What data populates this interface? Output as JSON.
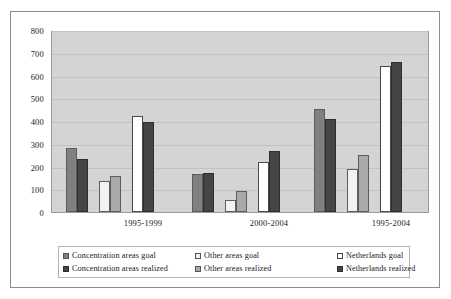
{
  "chart_data": {
    "type": "bar",
    "title": "",
    "xlabel": "",
    "ylabel": "",
    "ylim": [
      0,
      800
    ],
    "ytick_step": 100,
    "yticks": [
      "800",
      "700",
      "600",
      "500",
      "400",
      "300",
      "200",
      "100",
      "0"
    ],
    "grid": true,
    "legend_position": "bottom",
    "categories": [
      "1995-1999",
      "2000-2004",
      "1995-2004"
    ],
    "series": [
      {
        "name": "Concentration areas goal",
        "color": "#808080",
        "values": [
          285,
          168,
          458
        ]
      },
      {
        "name": "Concentration areas realized",
        "color": "#454545",
        "values": [
          237,
          172,
          413
        ]
      },
      {
        "name": "Other areas goal",
        "color": "#f2f2f2",
        "values": [
          140,
          52,
          192
        ]
      },
      {
        "name": "Other areas realized",
        "color": "#a9a9a9",
        "values": [
          158,
          95,
          253
        ]
      },
      {
        "name": "Netherlands goal",
        "color": "#ffffff",
        "values": [
          425,
          222,
          650
        ]
      },
      {
        "name": "Netherlands realized",
        "color": "#454545",
        "values": [
          398,
          270,
          668
        ]
      }
    ]
  },
  "legend": {
    "items": [
      "Concentration areas goal",
      "Concentration areas realized",
      "Other areas goal",
      "Other areas realized",
      "Netherlands goal",
      "Netherlands realized"
    ]
  }
}
